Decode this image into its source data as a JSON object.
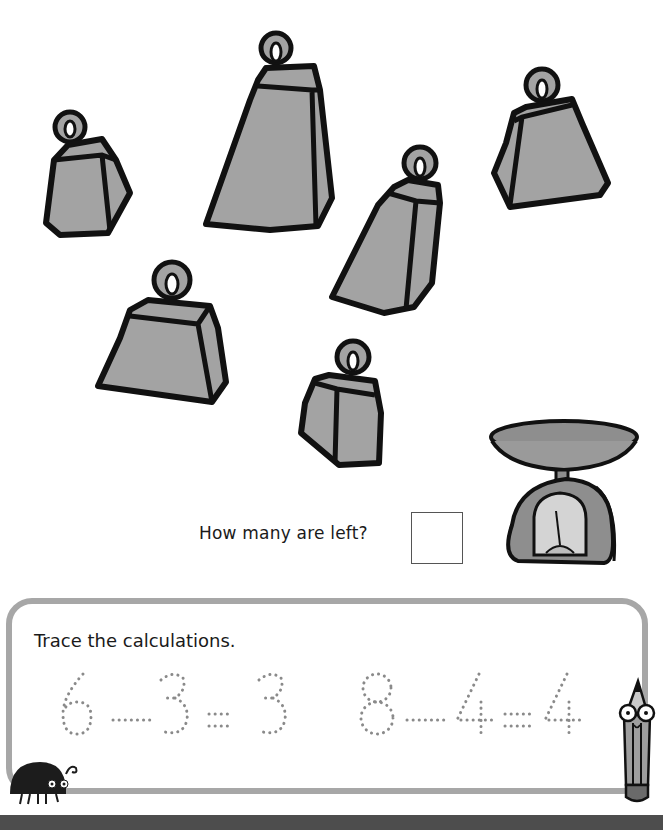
{
  "worksheet": {
    "weights": [
      {
        "id": 1,
        "label": "weight"
      },
      {
        "id": 2,
        "label": "weight"
      },
      {
        "id": 3,
        "label": "weight"
      },
      {
        "id": 4,
        "label": "weight"
      },
      {
        "id": 5,
        "label": "weight"
      },
      {
        "id": 6,
        "label": "weight"
      }
    ],
    "question": "How many are left?",
    "answer_box_value": "",
    "scale_icon": "kitchen-scale-icon"
  },
  "trace_section": {
    "title": "Trace the calculations.",
    "equations": [
      {
        "a": "6",
        "op": "−",
        "b": "3",
        "eq": "=",
        "result": "3"
      },
      {
        "a": "8",
        "op": "−",
        "b": "4",
        "eq": "=",
        "result": "4"
      }
    ]
  },
  "colors": {
    "weight_fill": "#a3a3a3",
    "outline": "#111111",
    "panel_border": "#a7a7a7",
    "dotted_digits": "#8a8a8a",
    "bottom_bar": "#4d4d4d"
  }
}
